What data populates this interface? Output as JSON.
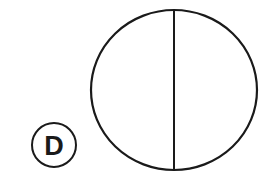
{
  "figure": {
    "label": "D",
    "stroke_color": "#1a1a1a",
    "background": "#ffffff",
    "shapes": {
      "main_circle": {
        "cx": 174,
        "cy": 90,
        "rx": 83,
        "ry": 80
      },
      "divider_line": {
        "orientation": "vertical",
        "x": 174,
        "y1": 10,
        "y2": 170
      },
      "label_circle": {
        "cx": 54,
        "cy": 145,
        "r": 22
      }
    }
  }
}
